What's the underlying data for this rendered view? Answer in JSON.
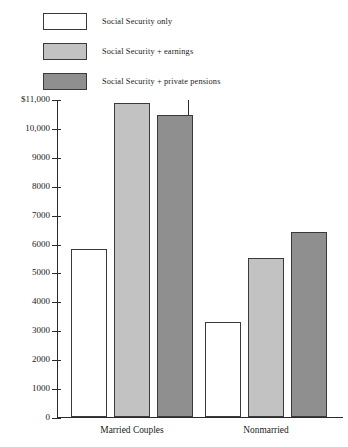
{
  "legend": {
    "items": [
      {
        "label": "Social Security only",
        "color": "#ffffff",
        "key": "ss_only"
      },
      {
        "label": "Social Security  +  earnings",
        "color": "#c2c2c2",
        "key": "ss_earnings"
      },
      {
        "label": "Social Security  +  private pensions",
        "color": "#8f8f8f",
        "key": "ss_pensions"
      }
    ]
  },
  "axis": {
    "y_ticks": [
      "$11,000",
      "10,000",
      "9000",
      "8000",
      "7000",
      "6000",
      "5000",
      "4000",
      "3000",
      "2000",
      "1000",
      "0"
    ],
    "x_categories": [
      "Married Couples",
      "Nonmarried"
    ]
  },
  "chart_data": {
    "type": "bar",
    "title": "",
    "xlabel": "",
    "ylabel": "",
    "ylim": [
      0,
      11000
    ],
    "ytick_step": 1000,
    "grid": false,
    "legend_position": "top-left",
    "categories": [
      "Married Couples",
      "Nonmarried"
    ],
    "series": [
      {
        "name": "Social Security only",
        "color": "#ffffff",
        "values": [
          5800,
          3300
        ]
      },
      {
        "name": "Social Security + earnings",
        "color": "#c2c2c2",
        "values": [
          10850,
          5500
        ]
      },
      {
        "name": "Social Security + private pensions",
        "color": "#8f8f8f",
        "values": [
          10450,
          6400
        ]
      }
    ]
  }
}
